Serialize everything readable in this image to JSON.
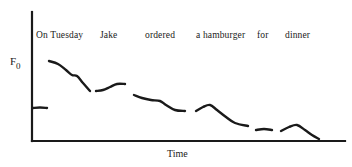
{
  "figure": {
    "kind": "f0-contour-schematic",
    "background_color": "#ffffff",
    "ink_color": "#1a1a1a",
    "width": 352,
    "height": 167
  },
  "axes": {
    "y_label_base": "F",
    "y_label_subscript": "0",
    "y_label_full": "F0",
    "x_label": "Time",
    "axis_color": "#1a1a1a",
    "axis_line_width": 2.2,
    "origin": {
      "x": 32,
      "y": 141
    },
    "y_top": 12,
    "x_right": 345,
    "ticks": "none",
    "grid": "off"
  },
  "utterance": {
    "full_text": "On Tuesday Jake ordered a hamburger for dinner",
    "words": [
      {
        "label": "On Tuesday",
        "x": 36,
        "y": 30
      },
      {
        "label": "Jake",
        "x": 100,
        "y": 30
      },
      {
        "label": "ordered",
        "x": 145,
        "y": 30
      },
      {
        "label": "a hamburger",
        "x": 196,
        "y": 30
      },
      {
        "label": "for",
        "x": 257,
        "y": 30
      },
      {
        "label": "dinner",
        "x": 285,
        "y": 30
      }
    ]
  },
  "chart_data": {
    "type": "line",
    "title": "",
    "subtitle": "",
    "xlabel": "Time",
    "ylabel": "F0",
    "xlim": [
      32,
      345
    ],
    "ylim_pixels": [
      141,
      12
    ],
    "grid": false,
    "legend": "none",
    "annotations": [
      "On Tuesday",
      "Jake",
      "ordered",
      "a hamburger",
      "for",
      "dinner"
    ],
    "stroke_color": "#1a1a1a",
    "stroke_width": 2.4,
    "series": [
      {
        "name": "On",
        "word": "On",
        "points": [
          [
            33,
            108
          ],
          [
            40,
            107.5
          ],
          [
            47,
            108
          ]
        ]
      },
      {
        "name": "Tuesday",
        "word": "Tuesday",
        "points": [
          [
            49,
            61
          ],
          [
            58,
            64
          ],
          [
            66,
            70
          ],
          [
            72,
            75
          ],
          [
            77,
            76
          ],
          [
            83,
            83
          ],
          [
            90,
            91
          ]
        ]
      },
      {
        "name": "Jake",
        "word": "Jake",
        "points": [
          [
            96,
            91
          ],
          [
            103,
            90
          ],
          [
            110,
            87
          ],
          [
            117,
            84
          ],
          [
            125,
            84
          ]
        ]
      },
      {
        "name": "ordered",
        "word": "ordered",
        "points": [
          [
            134,
            95
          ],
          [
            142,
            98
          ],
          [
            151,
            100
          ],
          [
            160,
            101
          ],
          [
            166,
            105
          ],
          [
            175,
            110
          ],
          [
            185,
            111
          ]
        ]
      },
      {
        "name": "a hamburger",
        "word": "a hamburger",
        "points": [
          [
            196,
            111
          ],
          [
            203,
            107
          ],
          [
            210,
            105
          ],
          [
            217,
            110
          ],
          [
            226,
            117
          ],
          [
            235,
            123
          ],
          [
            248,
            126
          ]
        ]
      },
      {
        "name": "for",
        "word": "for",
        "points": [
          [
            256,
            130
          ],
          [
            264,
            129
          ],
          [
            272,
            130
          ]
        ]
      },
      {
        "name": "dinner",
        "word": "dinner",
        "points": [
          [
            281,
            131
          ],
          [
            289,
            127
          ],
          [
            297,
            125
          ],
          [
            305,
            130
          ],
          [
            312,
            135
          ],
          [
            319,
            139
          ]
        ]
      }
    ]
  }
}
